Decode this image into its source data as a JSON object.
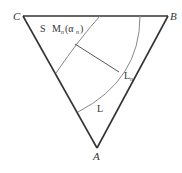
{
  "diagram": {
    "vertices": {
      "C": {
        "label": "C",
        "x": 23,
        "y": 16
      },
      "B": {
        "label": "B",
        "x": 168,
        "y": 16
      },
      "A": {
        "label": "A",
        "x": 97,
        "y": 150
      }
    },
    "labels": {
      "S": "S",
      "M": "M",
      "M_sub": "n",
      "alpha": "(α",
      "alpha_sub": "n",
      "alpha_close": ")",
      "Ln": "L",
      "Ln_sub": "n",
      "L": "L"
    },
    "colors": {
      "edge": "#333333",
      "curve": "#888888",
      "text": "#333333"
    }
  }
}
